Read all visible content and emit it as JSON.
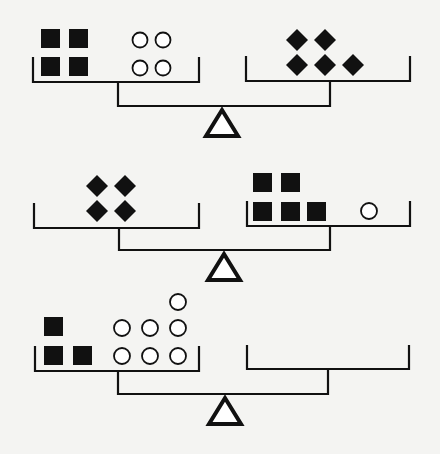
{
  "diagram": {
    "title": "",
    "colors": {
      "ink": "#111111",
      "paper": "#f4f4f2"
    },
    "scales": [
      {
        "id": "scale-1",
        "state": "balanced",
        "left_pan": {
          "squares": 4,
          "circles": 4,
          "diamonds": 0
        },
        "right_pan": {
          "squares": 0,
          "circles": 0,
          "diamonds": 5
        },
        "geometry": {
          "left_pan": {
            "x1": 33,
            "x2": 199,
            "top": 58,
            "bottom": 82
          },
          "right_pan": {
            "x1": 246,
            "x2": 410,
            "top": 57,
            "bottom": 81
          },
          "stem_left_x": 118,
          "stem_right_x": 330,
          "beam_y": 106,
          "fulcrum": {
            "apex_x": 222,
            "apex_y": 108,
            "base_y": 136,
            "half_w": 16
          }
        },
        "shapes": [
          {
            "type": "square",
            "x": 41,
            "y": 29,
            "s": 19
          },
          {
            "type": "square",
            "x": 69,
            "y": 29,
            "s": 19
          },
          {
            "type": "square",
            "x": 41,
            "y": 57,
            "s": 19
          },
          {
            "type": "square",
            "x": 69,
            "y": 57,
            "s": 19
          },
          {
            "type": "circle",
            "cx": 140,
            "cy": 40,
            "r": 7.5
          },
          {
            "type": "circle",
            "cx": 163,
            "cy": 40,
            "r": 7.5
          },
          {
            "type": "circle",
            "cx": 140,
            "cy": 68,
            "r": 7.5
          },
          {
            "type": "circle",
            "cx": 163,
            "cy": 68,
            "r": 7.5
          },
          {
            "type": "diamond",
            "cx": 297,
            "cy": 40,
            "r": 11
          },
          {
            "type": "diamond",
            "cx": 325,
            "cy": 40,
            "r": 11
          },
          {
            "type": "diamond",
            "cx": 297,
            "cy": 65,
            "r": 11
          },
          {
            "type": "diamond",
            "cx": 325,
            "cy": 65,
            "r": 11
          },
          {
            "type": "diamond",
            "cx": 353,
            "cy": 65,
            "r": 11
          }
        ]
      },
      {
        "id": "scale-2",
        "state": "balanced",
        "left_pan": {
          "squares": 0,
          "circles": 0,
          "diamonds": 4
        },
        "right_pan": {
          "squares": 5,
          "circles": 1,
          "diamonds": 0
        },
        "geometry": {
          "left_pan": {
            "x1": 34,
            "x2": 199,
            "top": 204,
            "bottom": 228
          },
          "right_pan": {
            "x1": 247,
            "x2": 410,
            "top": 202,
            "bottom": 226
          },
          "stem_left_x": 119,
          "stem_right_x": 330,
          "beam_y": 250,
          "fulcrum": {
            "apex_x": 224,
            "apex_y": 252,
            "base_y": 280,
            "half_w": 16
          }
        },
        "shapes": [
          {
            "type": "diamond",
            "cx": 97,
            "cy": 186,
            "r": 11
          },
          {
            "type": "diamond",
            "cx": 125,
            "cy": 186,
            "r": 11
          },
          {
            "type": "diamond",
            "cx": 97,
            "cy": 211,
            "r": 11
          },
          {
            "type": "diamond",
            "cx": 125,
            "cy": 211,
            "r": 11
          },
          {
            "type": "square",
            "x": 253,
            "y": 173,
            "s": 19
          },
          {
            "type": "square",
            "x": 281,
            "y": 173,
            "s": 19
          },
          {
            "type": "square",
            "x": 253,
            "y": 202,
            "s": 19
          },
          {
            "type": "square",
            "x": 281,
            "y": 202,
            "s": 19
          },
          {
            "type": "square",
            "x": 307,
            "y": 202,
            "s": 19
          },
          {
            "type": "circle",
            "cx": 369,
            "cy": 211,
            "r": 8
          }
        ]
      },
      {
        "id": "scale-3",
        "state": "question",
        "left_pan": {
          "squares": 3,
          "circles": 7,
          "diamonds": 0
        },
        "right_pan": {
          "squares": 0,
          "circles": 0,
          "diamonds": 0
        },
        "geometry": {
          "left_pan": {
            "x1": 35,
            "x2": 199,
            "top": 347,
            "bottom": 371
          },
          "right_pan": {
            "x1": 247,
            "x2": 409,
            "top": 346,
            "bottom": 369
          },
          "stem_left_x": 118,
          "stem_right_x": 328,
          "beam_y": 394,
          "fulcrum": {
            "apex_x": 225,
            "apex_y": 396,
            "base_y": 424,
            "half_w": 16
          }
        },
        "shapes": [
          {
            "type": "square",
            "x": 44,
            "y": 317,
            "s": 19
          },
          {
            "type": "square",
            "x": 44,
            "y": 346,
            "s": 19
          },
          {
            "type": "square",
            "x": 73,
            "y": 346,
            "s": 19
          },
          {
            "type": "circle",
            "cx": 178,
            "cy": 302,
            "r": 8
          },
          {
            "type": "circle",
            "cx": 122,
            "cy": 328,
            "r": 8
          },
          {
            "type": "circle",
            "cx": 150,
            "cy": 328,
            "r": 8
          },
          {
            "type": "circle",
            "cx": 178,
            "cy": 328,
            "r": 8
          },
          {
            "type": "circle",
            "cx": 122,
            "cy": 356,
            "r": 8
          },
          {
            "type": "circle",
            "cx": 150,
            "cy": 356,
            "r": 8
          },
          {
            "type": "circle",
            "cx": 178,
            "cy": 356,
            "r": 8
          }
        ]
      }
    ]
  }
}
